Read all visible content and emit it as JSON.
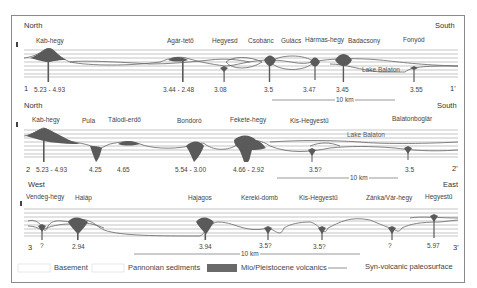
{
  "sections": [
    {
      "id": "1",
      "start_label": "1",
      "end_label": "1'",
      "direction_left": "North",
      "direction_right": "South",
      "localities": [
        "Kab-hegy",
        "Agár-tető",
        "Hegyesd",
        "Csobánc",
        "Gulács",
        "Hármas-hegy",
        "Badacsony",
        "Fonyód"
      ],
      "ages": [
        "5.23 - 4.93",
        "3.44 - 2.48",
        "3.08",
        "3.5",
        "3.47",
        "3.45",
        "3.55"
      ],
      "lake_label": "Lake Balaton",
      "scale_label": "10 km"
    },
    {
      "id": "2",
      "start_label": "2",
      "end_label": "2'",
      "direction_left": "North",
      "direction_right": "South",
      "localities": [
        "Kab-hegy",
        "Pula",
        "Tálodi-erdő",
        "Bondoró",
        "Fekete-hegy",
        "Kis-Hegyestű",
        "Balatonboglár"
      ],
      "ages": [
        "5.23 - 4.93",
        "4.25",
        "4.65",
        "5.54 - 3.00",
        "4.66 - 2.92",
        "3.5?",
        "3.5"
      ],
      "lake_label": "Lake Balaton",
      "scale_label": "10 km"
    },
    {
      "id": "3",
      "start_label": "3",
      "end_label": "3'",
      "direction_left": "West",
      "direction_right": "East",
      "localities": [
        "Vendeg-hegy",
        "Haláp",
        "Hajagos",
        "Kereki-domb",
        "Kis-Hegyestű",
        "Zánka/Vár-hegy",
        "Hegyestű"
      ],
      "ages": [
        "?",
        "2.94",
        "3.94",
        "3.5?",
        "3.5?",
        "?",
        "5.97"
      ],
      "scale_label": "10 km"
    }
  ],
  "legend": [
    {
      "label": "Basement",
      "swatch": "#ffffff"
    },
    {
      "label": "Pannonian sediments",
      "swatch": "#ffffff"
    },
    {
      "label": "Mio/Pleistocene volcanics",
      "swatch": "#6e6e6e"
    },
    {
      "label": "Syn-volcanic paleosurface",
      "swatch": "line"
    }
  ],
  "colors": {
    "volcanics": "#5f5f5f",
    "gridline": "#9a9a9a",
    "frame": "#8a8a8a",
    "paleosurface": "#777777"
  }
}
